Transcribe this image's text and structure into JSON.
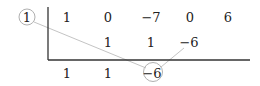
{
  "diagram": {
    "divisor": "1",
    "coefficients": [
      "1",
      "0",
      "−7",
      "0",
      "6"
    ],
    "middle_row": [
      "",
      "1",
      "1",
      "−6",
      ""
    ],
    "result_row": [
      "1",
      "1",
      "−6",
      "",
      ""
    ],
    "highlighted_result": "−6",
    "colors": {
      "text": "#222222",
      "frame_line": "#333333",
      "connector_line": "#bbbbbb",
      "circle": "#aaaaaa"
    }
  }
}
